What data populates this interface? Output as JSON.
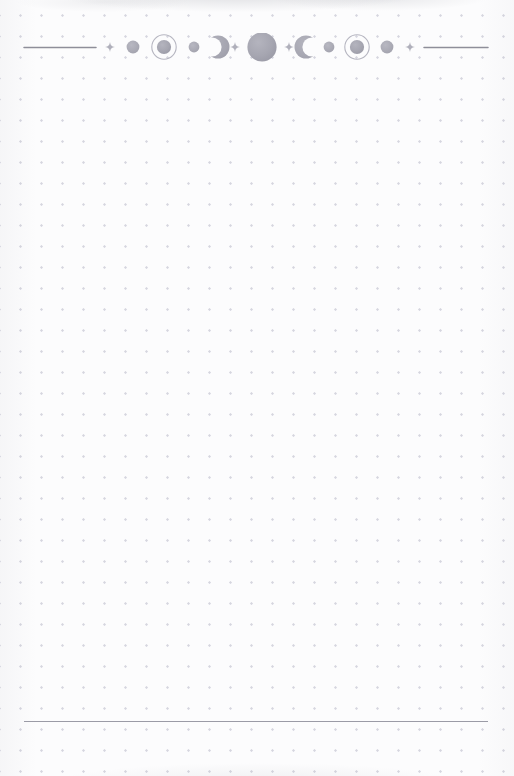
{
  "page": {
    "width": 514,
    "height": 776,
    "kind": "dot-grid journal page",
    "paper_color": "#fcfcfd",
    "dot_color": "#d6d6df",
    "dot_spacing_px": 21,
    "text_content": []
  },
  "header_ornament": {
    "name": "lunar-phase divider",
    "center_x": 257,
    "baseline_y": 47,
    "ink_color": "#a9a9b4",
    "rule_color": "#8e8e99",
    "elements": [
      {
        "type": "rule",
        "name": "left-rule",
        "x": 24,
        "width": 72
      },
      {
        "type": "sparkle",
        "name": "sparkle-left-outer",
        "x": 110,
        "size": 9
      },
      {
        "type": "disc",
        "name": "moon-small-left",
        "x": 133,
        "size": 13
      },
      {
        "type": "ringed",
        "name": "moon-ringed-left",
        "x": 164,
        "size": 14,
        "ring": 25
      },
      {
        "type": "disc",
        "name": "moon-dot-left",
        "x": 194,
        "size": 11
      },
      {
        "type": "crescent",
        "name": "crescent-waning",
        "x": 213,
        "size": 24,
        "facing": "left"
      },
      {
        "type": "sparkle",
        "name": "sparkle-left-inner",
        "x": 235,
        "size": 9
      },
      {
        "type": "disc",
        "name": "moon-full-center",
        "x": 262,
        "size": 29
      },
      {
        "type": "sparkle",
        "name": "sparkle-right-inner",
        "x": 289,
        "size": 9
      },
      {
        "type": "crescent",
        "name": "crescent-waxing",
        "x": 310,
        "size": 24,
        "facing": "right"
      },
      {
        "type": "disc",
        "name": "moon-dot-right",
        "x": 329,
        "size": 11
      },
      {
        "type": "ringed",
        "name": "moon-ringed-right",
        "x": 357,
        "size": 14,
        "ring": 25
      },
      {
        "type": "disc",
        "name": "moon-small-right",
        "x": 387,
        "size": 13
      },
      {
        "type": "sparkle",
        "name": "sparkle-right-outer",
        "x": 410,
        "size": 9
      },
      {
        "type": "rule",
        "name": "right-rule",
        "x": 424,
        "width": 64
      }
    ]
  },
  "footer": {
    "rule": {
      "name": "footer-rule",
      "x": 24,
      "y": 721,
      "width": 464,
      "color": "#9b9ba6"
    }
  }
}
